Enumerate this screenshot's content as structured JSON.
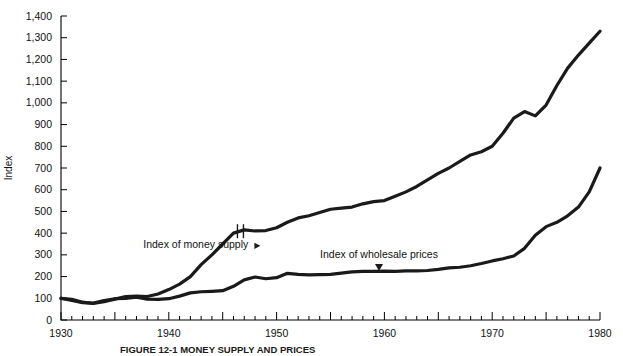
{
  "chart_data": {
    "type": "line",
    "title": "FIGURE 12-1 MONEY SUPPLY AND PRICES",
    "xlabel": "",
    "ylabel": "Index",
    "xlim": [
      1930,
      1980
    ],
    "ylim": [
      0,
      1400
    ],
    "grid": false,
    "legend_position": "in-plot annotations",
    "y_ticks": [
      0,
      100,
      200,
      300,
      400,
      500,
      600,
      700,
      800,
      900,
      1000,
      1100,
      1200,
      1300,
      1400
    ],
    "y_tick_labels": [
      "0",
      "100",
      "200",
      "300",
      "400",
      "500",
      "600",
      "700",
      "800",
      "900",
      "1,000",
      "1,100",
      "1,200",
      "1,300",
      "1,400"
    ],
    "x_ticks": [
      1930,
      1940,
      1950,
      1960,
      1970,
      1980
    ],
    "x_tick_labels": [
      "1930",
      "1940",
      "1950",
      "1960",
      "1970",
      "1980"
    ],
    "x_minor_tick_interval": 1,
    "annotations": [
      {
        "text": "Index of money supply",
        "x": 1942.5,
        "y": 330,
        "pointer": "right"
      },
      {
        "text": "Index of wholesale prices",
        "x": 1959.5,
        "y": 285,
        "pointer": "down"
      }
    ],
    "series_break": {
      "x": 1946.6,
      "series": "Index of money supply",
      "note": "series discontinuity marker"
    },
    "series": [
      {
        "name": "Index of money supply",
        "color": "#1a1a1a",
        "x": [
          1930,
          1931,
          1932,
          1933,
          1934,
          1935,
          1936,
          1937,
          1938,
          1939,
          1940,
          1941,
          1942,
          1943,
          1944,
          1945,
          1946,
          1947,
          1948,
          1949,
          1950,
          1951,
          1952,
          1953,
          1954,
          1955,
          1956,
          1957,
          1958,
          1959,
          1960,
          1961,
          1962,
          1963,
          1964,
          1965,
          1966,
          1967,
          1968,
          1969,
          1970,
          1971,
          1972,
          1973,
          1974,
          1975,
          1976,
          1977,
          1978,
          1979,
          1980
        ],
        "values": [
          100,
          95,
          82,
          76,
          84,
          96,
          108,
          110,
          108,
          120,
          140,
          165,
          200,
          255,
          300,
          350,
          400,
          415,
          410,
          412,
          425,
          450,
          470,
          480,
          495,
          510,
          515,
          520,
          535,
          545,
          550,
          570,
          590,
          615,
          645,
          675,
          700,
          730,
          760,
          775,
          800,
          860,
          930,
          960,
          940,
          990,
          1080,
          1160,
          1220,
          1275,
          1330
        ]
      },
      {
        "name": "Index of wholesale prices",
        "color": "#1a1a1a",
        "x": [
          1930,
          1931,
          1932,
          1933,
          1934,
          1935,
          1936,
          1937,
          1938,
          1939,
          1940,
          1941,
          1942,
          1943,
          1944,
          1945,
          1946,
          1947,
          1948,
          1949,
          1950,
          1951,
          1952,
          1953,
          1954,
          1955,
          1956,
          1957,
          1958,
          1959,
          1960,
          1961,
          1962,
          1963,
          1964,
          1965,
          1966,
          1967,
          1968,
          1969,
          1970,
          1971,
          1972,
          1973,
          1974,
          1975,
          1976,
          1977,
          1978,
          1979,
          1980
        ],
        "values": [
          100,
          90,
          80,
          78,
          90,
          98,
          100,
          105,
          96,
          95,
          98,
          110,
          125,
          130,
          132,
          135,
          155,
          185,
          198,
          190,
          195,
          215,
          210,
          208,
          209,
          210,
          216,
          222,
          224,
          224,
          225,
          224,
          226,
          226,
          228,
          233,
          240,
          243,
          250,
          260,
          272,
          282,
          295,
          330,
          390,
          430,
          450,
          480,
          520,
          590,
          700
        ]
      }
    ]
  },
  "figure": {
    "caption": "FIGURE 12-1 MONEY SUPPLY AND PRICES"
  }
}
